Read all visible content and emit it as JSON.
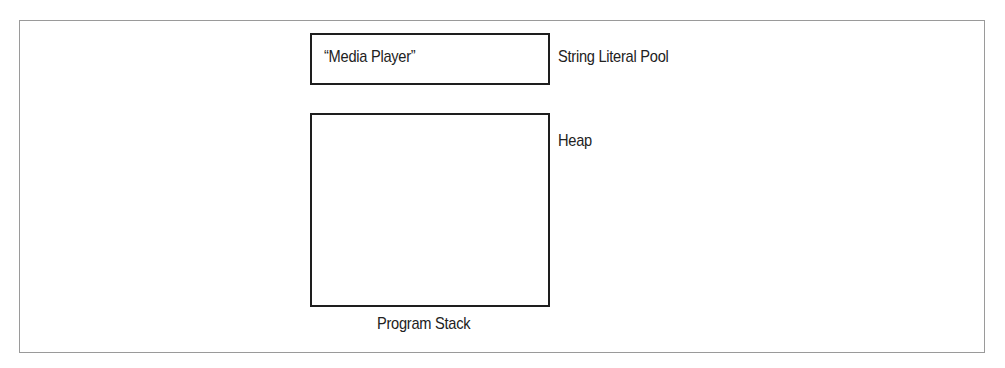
{
  "diagram": {
    "regions": [
      {
        "id": "string-literal-pool",
        "label": "String Literal Pool",
        "contents": "“Media Player”"
      },
      {
        "id": "heap",
        "label": "Heap",
        "contents": ""
      },
      {
        "id": "program-stack",
        "label": "Program Stack"
      }
    ]
  },
  "colors": {
    "frame": "#9a9a9a",
    "box_border": "#1e1e1e",
    "text": "#222222",
    "background": "#ffffff"
  }
}
